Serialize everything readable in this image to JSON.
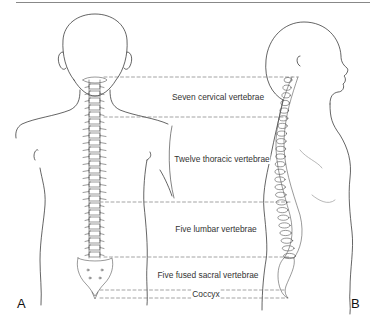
{
  "figure": {
    "panels": [
      {
        "id": "A",
        "label": "A",
        "view": "posterior"
      },
      {
        "id": "B",
        "label": "B",
        "view": "lateral"
      }
    ],
    "regions": [
      {
        "name": "cervical",
        "label": "Seven cervical vertebrae"
      },
      {
        "name": "thoracic",
        "label": "Twelve thoracic vertebrae"
      },
      {
        "name": "lumbar",
        "label": "Five lumbar vertebrae"
      },
      {
        "name": "sacral",
        "label": "Five fused sacral vertebrae"
      },
      {
        "name": "coccyx",
        "label": "Coccyx"
      }
    ],
    "colors": {
      "line": "#222222",
      "spine": "#555555",
      "dash": "#666666",
      "rule": "#888888"
    }
  }
}
